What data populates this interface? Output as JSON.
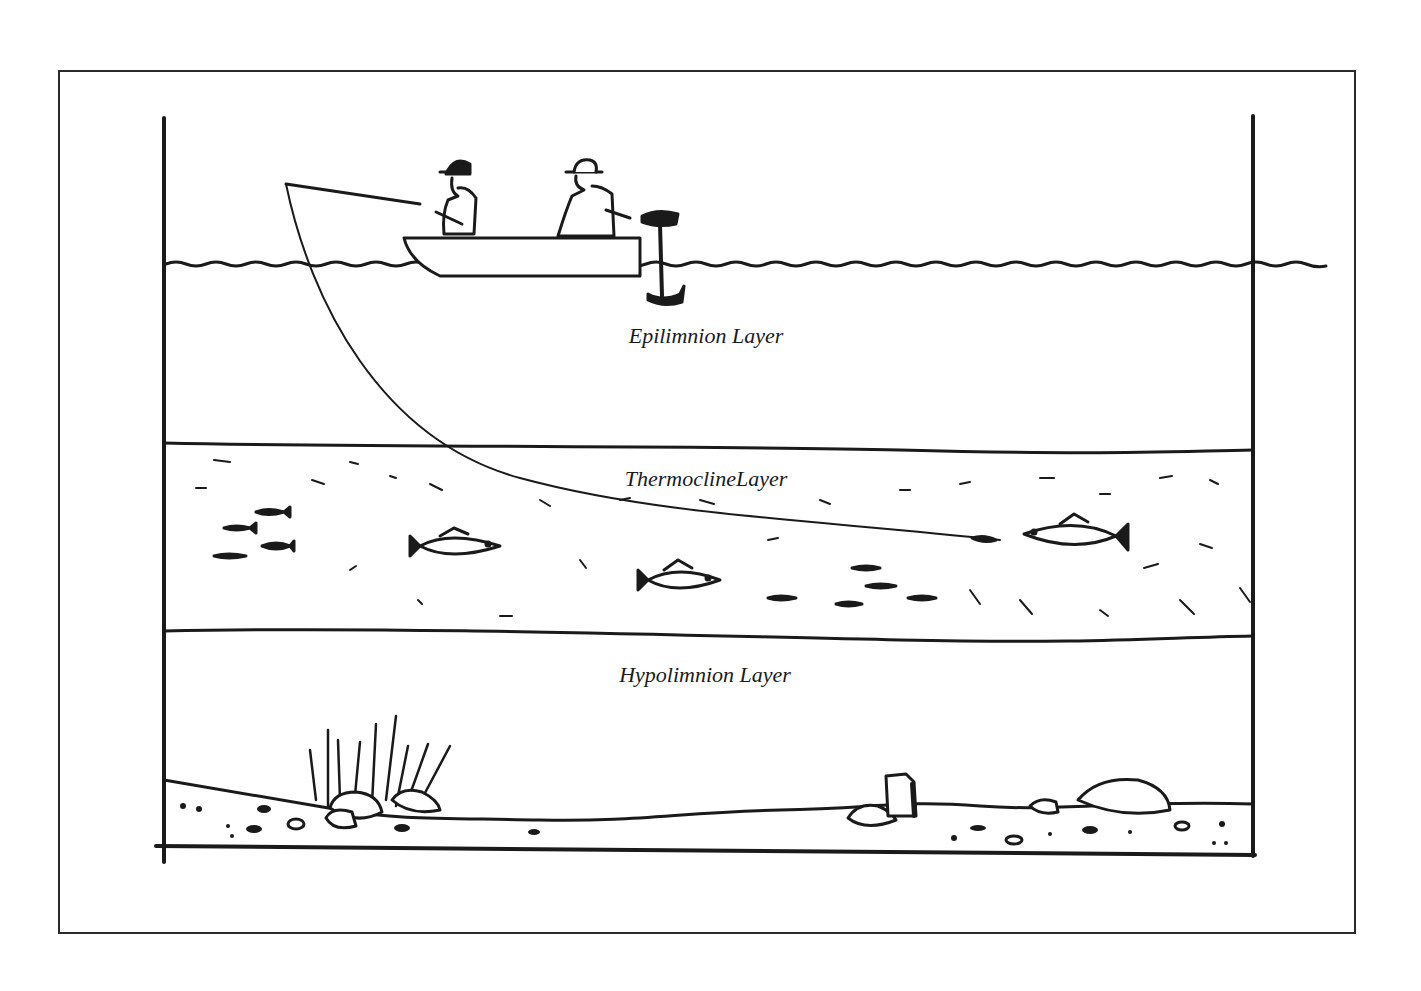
{
  "diagram": {
    "title": "",
    "layers": [
      {
        "id": "epilimnion",
        "label": "Epilimnion Layer"
      },
      {
        "id": "thermocline",
        "label": "ThermoclineLayer"
      },
      {
        "id": "hypolimnion",
        "label": "Hypolimnion Layer"
      }
    ],
    "elements": {
      "boat": "boat-with-two-anglers",
      "fishing_line": "fishing-line-into-thermocline",
      "outboard_motor": "outboard-motor",
      "large_fish_count": 3,
      "baitfish_count": 10,
      "weeds": "weed-bed",
      "rocks": "bottom-rocks",
      "stump": "stump"
    },
    "colors": {
      "ink": "#1a1a1a",
      "background": "#ffffff"
    }
  }
}
